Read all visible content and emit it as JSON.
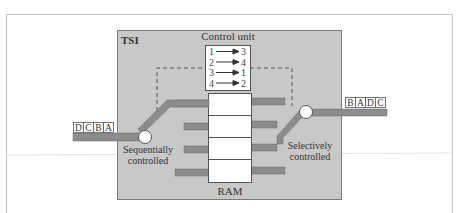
{
  "diagram": {
    "title": "TSI",
    "control_unit": {
      "label": "Control unit",
      "mappings": [
        {
          "from": "1",
          "to": "3"
        },
        {
          "from": "2",
          "to": "4"
        },
        {
          "from": "3",
          "to": "1"
        },
        {
          "from": "4",
          "to": "2"
        }
      ]
    },
    "ram": {
      "label": "RAM",
      "slot_count": 4
    },
    "input": {
      "slots": [
        "D",
        "C",
        "B",
        "A"
      ],
      "switch_label_line1": "Sequentially",
      "switch_label_line2": "controlled"
    },
    "output": {
      "slots": [
        "B",
        "A",
        "D",
        "C"
      ],
      "switch_label_line1": "Selectively",
      "switch_label_line2": "controlled"
    },
    "colors": {
      "tsi_fill": "#c8c8c8",
      "tsi_border": "#808080",
      "bar_fill": "#8c8c8c",
      "bar_border": "#6e6e6e",
      "frame_border": "#c8c8c8",
      "text": "#333333",
      "box_fill": "#ffffff",
      "dashed": "#555555"
    }
  }
}
